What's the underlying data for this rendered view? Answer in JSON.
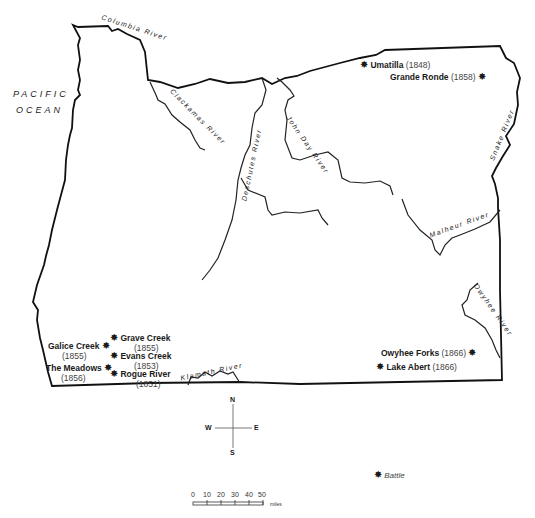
{
  "map": {
    "ocean_label": [
      "PACIFIC",
      "OCEAN"
    ],
    "rivers": {
      "columbia": "Columbia River",
      "clackamas": "Clackamas River",
      "deschutes": "Deschutes River",
      "john_day": "John Day River",
      "snake": "Snake River",
      "malheur": "Malheur River",
      "owyhee": "Owyhee River",
      "klamath": "Klamath River"
    },
    "battles": [
      {
        "name": "Umatilla",
        "year": "(1848)"
      },
      {
        "name": "Grande Ronde",
        "year": "(1858)"
      },
      {
        "name": "Grave Creek",
        "year": "(1855)"
      },
      {
        "name": "Galice Creek",
        "year": "(1855)"
      },
      {
        "name": "Evans Creek",
        "year": "(1853)"
      },
      {
        "name": "The Meadows",
        "year": "(1856)"
      },
      {
        "name": "Rogue River",
        "year": "(1851)"
      },
      {
        "name": "Owyhee Forks",
        "year": "(1866)"
      },
      {
        "name": "Lake Abert",
        "year": "(1866)"
      }
    ],
    "compass": {
      "n": "N",
      "s": "S",
      "e": "E",
      "w": "W"
    },
    "legend": {
      "symbol": "✸",
      "label": "Battle"
    },
    "scale": {
      "ticks": [
        "0",
        "10",
        "20",
        "30",
        "40",
        "50"
      ],
      "unit": "miles"
    }
  }
}
